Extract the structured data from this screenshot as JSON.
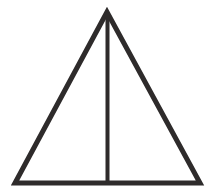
{
  "diagram": {
    "type": "geometric-figure",
    "shape": "isosceles-triangle",
    "apex": [
      107,
      12
    ],
    "base_left": [
      14,
      185
    ],
    "base_right": [
      201,
      185
    ],
    "altitude": {
      "from": [
        107,
        12
      ],
      "to": [
        107,
        185
      ]
    },
    "stroke_color": "#2e2b2b",
    "stroke_width": 5,
    "background": "#ffffff"
  }
}
